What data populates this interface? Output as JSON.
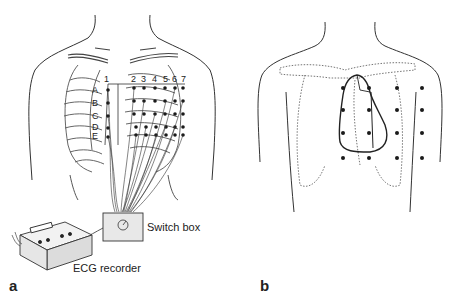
{
  "figure": {
    "panels": [
      {
        "id": "a",
        "label": "a",
        "column_labels": [
          "1",
          "2",
          "3",
          "4",
          "5",
          "6",
          "7"
        ],
        "row_labels": [
          "A",
          "B",
          "C",
          "D",
          "E"
        ],
        "switch_box_label": "Switch box",
        "recorder_label": "ECG recorder"
      },
      {
        "id": "b",
        "label": "b"
      }
    ],
    "colors": {
      "line": "#333333",
      "dot": "#1a1a1a",
      "background": "#ffffff"
    }
  }
}
